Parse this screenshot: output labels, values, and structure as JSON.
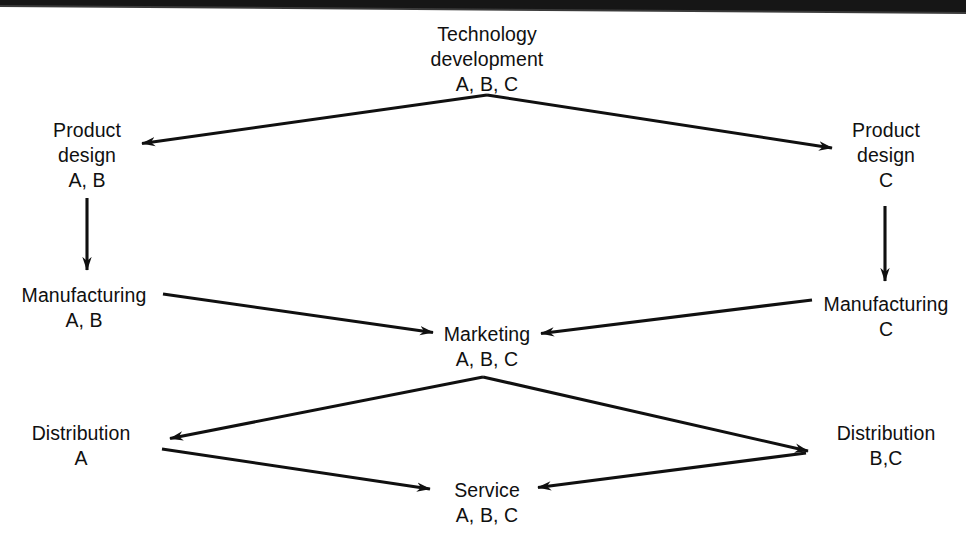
{
  "diagram": {
    "type": "flow-diagram",
    "background_color": "#ffffff",
    "line_color": "#101010",
    "text_color": "#101010",
    "nodes": [
      {
        "id": "technology-development",
        "name": "Technology development",
        "lines": [
          "Technology",
          "development"
        ],
        "codes": "A, B, C",
        "x": 487,
        "y": 22
      },
      {
        "id": "product-design-left",
        "name": "Product design",
        "lines": [
          "Product",
          "design"
        ],
        "codes": "A, B",
        "x": 87,
        "y": 118
      },
      {
        "id": "product-design-right",
        "name": "Product design",
        "lines": [
          "Product",
          "design"
        ],
        "codes": "C",
        "x": 886,
        "y": 118
      },
      {
        "id": "manufacturing-left",
        "name": "Manufacturing",
        "lines": [
          "Manufacturing"
        ],
        "codes": "A, B",
        "x": 84,
        "y": 283
      },
      {
        "id": "manufacturing-right",
        "name": "Manufacturing",
        "lines": [
          "Manufacturing"
        ],
        "codes": "C",
        "x": 886,
        "y": 292
      },
      {
        "id": "marketing",
        "name": "Marketing",
        "lines": [
          "Marketing"
        ],
        "codes": "A, B, C",
        "x": 487,
        "y": 322
      },
      {
        "id": "distribution-left",
        "name": "Distribution",
        "lines": [
          "Distribution"
        ],
        "codes": "A",
        "x": 81,
        "y": 421
      },
      {
        "id": "distribution-right",
        "name": "Distribution",
        "lines": [
          "Distribution"
        ],
        "codes": "B,C",
        "x": 886,
        "y": 421
      },
      {
        "id": "service",
        "name": "Service",
        "lines": [
          "Service"
        ],
        "codes": "A, B, C",
        "x": 487,
        "y": 478
      }
    ],
    "edges": [
      {
        "id": "tech-to-product-design-left",
        "from": "technology-development",
        "to": "product-design-left",
        "label": ""
      },
      {
        "id": "tech-to-product-design-right",
        "from": "technology-development",
        "to": "product-design-right",
        "label": ""
      },
      {
        "id": "product-design-left-to-manufacturing-left",
        "from": "product-design-left",
        "to": "manufacturing-left",
        "label": ""
      },
      {
        "id": "product-design-right-to-manufacturing-right",
        "from": "product-design-right",
        "to": "manufacturing-right",
        "label": ""
      },
      {
        "id": "manufacturing-left-to-marketing",
        "from": "manufacturing-left",
        "to": "marketing",
        "label": ""
      },
      {
        "id": "manufacturing-right-to-marketing",
        "from": "manufacturing-right",
        "to": "marketing",
        "label": ""
      },
      {
        "id": "marketing-to-distribution-left",
        "from": "marketing",
        "to": "distribution-left",
        "label": ""
      },
      {
        "id": "marketing-to-distribution-right",
        "from": "marketing",
        "to": "distribution-right",
        "label": ""
      },
      {
        "id": "distribution-left-to-service",
        "from": "distribution-left",
        "to": "service",
        "label": ""
      },
      {
        "id": "distribution-right-to-service",
        "from": "distribution-right",
        "to": "service",
        "label": ""
      }
    ]
  }
}
